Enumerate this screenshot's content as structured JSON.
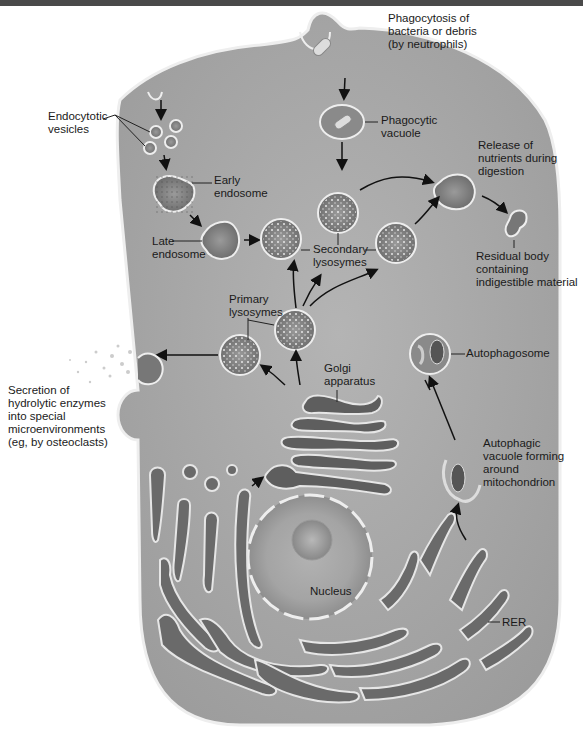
{
  "diagram": {
    "colors": {
      "cytoplasm": "#a9a9a9",
      "membrane": "#eeeeee",
      "organelle_dark": "#6e6e6e",
      "text": "#1a1a1a",
      "top_bar": "#4a4a4a"
    },
    "labels": {
      "phagocytosis": "Phagocytosis of\nbacteria or debris\n(by neutrophils)",
      "phagocytic_vacuole": "Phagocytic\nvacuole",
      "endocytotic_vesicles": "Endocytotic\nvesicles",
      "early_endosome": "Early\nendosome",
      "late_endosome": "Late\nendosome",
      "release_nutrients": "Release of\nnutrients during\ndigestion",
      "residual_body": "Residual body\ncontaining\nindigestible material",
      "secondary_lysosymes": "Secondary\nlysosymes",
      "primary_lysosymes": "Primary\nlysosymes",
      "autophagosome": "Autophagosome",
      "golgi": "Golgi\napparatus",
      "secretion": "Secretion of\nhydrolytic enzymes\ninto special\nmicroenvironments\n(eg, by osteoclasts)",
      "autophagic_vacuole": "Autophagic\nvacuole forming\naround\nmitochondrion",
      "nucleus": "Nucleus",
      "rer": "RER"
    }
  }
}
